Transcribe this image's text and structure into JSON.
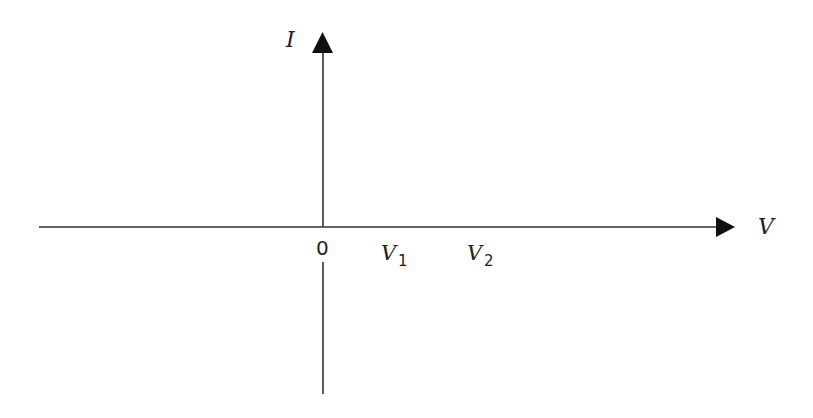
{
  "diagram": {
    "type": "axes",
    "colors": {
      "axis": "#333333",
      "text": "#222222",
      "background": "#ffffff"
    },
    "y_axis": {
      "label": "I",
      "direction": "up"
    },
    "x_axis": {
      "label": "V",
      "direction": "right"
    },
    "origin_label": "0",
    "tick_labels": [
      {
        "main": "V",
        "sub": "1"
      },
      {
        "main": "V",
        "sub": "2"
      }
    ]
  }
}
